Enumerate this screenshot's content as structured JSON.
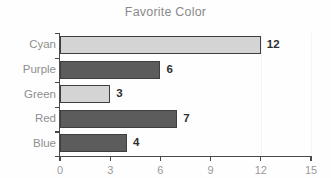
{
  "chart_data": {
    "type": "bar",
    "orientation": "horizontal",
    "title": "Favorite Color",
    "xlabel": "",
    "ylabel": "",
    "categories": [
      "Cyan",
      "Purple",
      "Green",
      "Red",
      "Blue"
    ],
    "values": [
      12,
      6,
      3,
      7,
      4
    ],
    "value_labels": [
      "12",
      "6",
      "3",
      "7",
      "4"
    ],
    "bar_styles": [
      "light",
      "dark",
      "light",
      "dark",
      "dark"
    ],
    "xlim": [
      0,
      15
    ],
    "xticks": [
      0,
      3,
      6,
      9,
      12,
      15
    ],
    "xtick_labels": [
      "0",
      "3",
      "6",
      "9",
      "12",
      "15"
    ],
    "grid": false,
    "legend": false
  },
  "colors": {
    "background": "#fefefe",
    "title_text": "#8a8a8a",
    "tick_text": "#9a9a9a",
    "category_text": "#8e8e8e",
    "value_text": "#2e2e2e",
    "axis_line": "#4a4a4a",
    "bar_light_fill": "#d4d4d4",
    "bar_dark_fill": "#5c5c5c",
    "bar_border": "#3f3f3f"
  }
}
